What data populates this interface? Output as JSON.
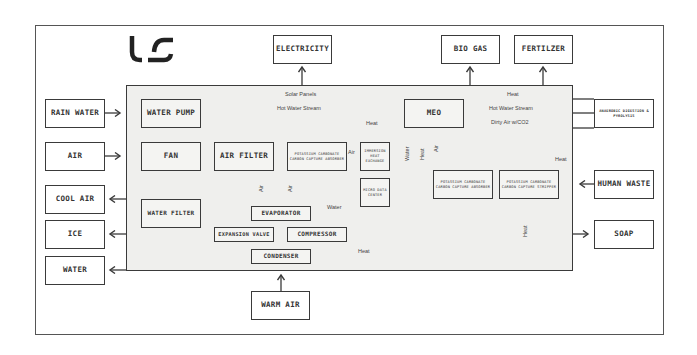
{
  "logo": {
    "text": "LS",
    "icon": "ls-logo-icon"
  },
  "outputs_top": [
    {
      "id": "electricity",
      "label": "ELECTRICITY"
    },
    {
      "id": "bio-gas",
      "label": "BIO GAS"
    },
    {
      "id": "fertilizer",
      "label": "FERTILZER"
    }
  ],
  "inputs_left": [
    {
      "id": "rain-water",
      "label": "RAIN WATER"
    },
    {
      "id": "air",
      "label": "AIR"
    }
  ],
  "outputs_left": [
    {
      "id": "cool-air",
      "label": "COOL AIR"
    },
    {
      "id": "ice",
      "label": "ICE"
    },
    {
      "id": "water",
      "label": "WATER"
    }
  ],
  "inputs_bottom": [
    {
      "id": "warm-air",
      "label": "WARM AIR"
    }
  ],
  "right_side": {
    "anaerobic": "ANAEROBIC DIGESTION & PYROLYSIS",
    "human_waste": "HUMAN WASTE",
    "soap": "SOAP"
  },
  "components": {
    "water_pump": "WATER PUMP",
    "fan": "FAN",
    "air_filter": "AIR FILTER",
    "water_filter": "WATER FILTER",
    "pc_absorber_1": "POTASSIUM CARBONATE CARBON CAPTURE ABSORBER",
    "immersion_hx": "IMMERSION HEAT EXCHANGE",
    "micro_data": "MICRO DATA CENTER",
    "meo": "MEO",
    "pc_absorber_2": "POTASSIUM CARBONATE CARBON CAPTURE ABSORBER",
    "pc_stripper": "POTASSIUM CARBONATE CARBON CAPTURE STRIPPER",
    "evaporator": "EVAPORATOR",
    "expansion_valve": "EXPANSION VALVE",
    "compressor": "COMPRESSOR",
    "condenser": "CONDENSER"
  },
  "flow_labels": {
    "solar_panels": "Solar Panels",
    "hot_water_stream_1": "Hot Water Stream",
    "heat_top": "Heat",
    "hot_water_stream_2": "Hot Water Stream",
    "dirty_air": "Dirty Air w/CO2",
    "heat_immersion": "Heat",
    "air_pc": "Air",
    "air_v1": "Air",
    "air_v2": "Air",
    "water_v": "Water",
    "heat_v": "Heat",
    "air_v3": "Air",
    "heat_right": "Heat",
    "water_evap": "Water",
    "heat_cond": "Heat",
    "heat_stripper": "Heat"
  },
  "colors": {
    "line": "#3a3a3a",
    "panel": "#efefed",
    "box": "#ffffff"
  }
}
